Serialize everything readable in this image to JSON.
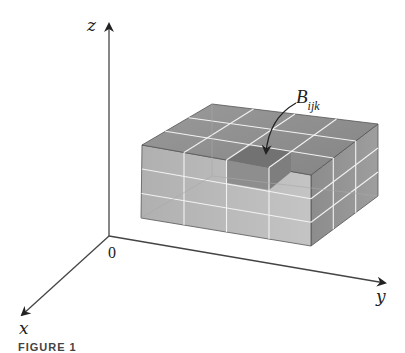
{
  "figure": {
    "caption": "FIGURE 1",
    "axes": {
      "z_label": "z",
      "x_label": "x",
      "y_label": "y",
      "origin_label": "0"
    },
    "box": {
      "label_main": "B",
      "label_sub": "ijk",
      "subdivisions": {
        "along_y": 4,
        "along_x": 3,
        "along_z": 3
      },
      "colors": {
        "top_face": "#8f8f8f",
        "front_face": "#b9b9b9",
        "right_face": "#8a8a8a",
        "highlight_cell": "#6f6f6f",
        "grid_lines": "#f4f4f4"
      }
    }
  }
}
